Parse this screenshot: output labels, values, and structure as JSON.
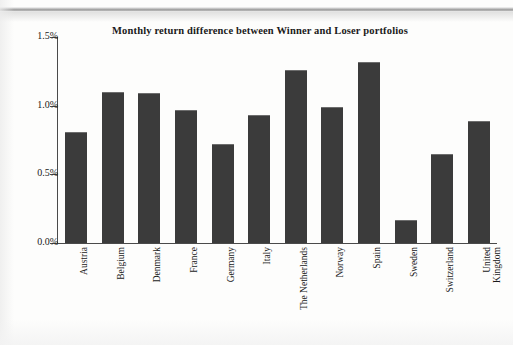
{
  "chart_data": {
    "type": "bar",
    "title": "Monthly return difference between Winner and Loser portfolios",
    "xlabel": "",
    "ylabel": "",
    "ylim": [
      0,
      1.5
    ],
    "ytick_labels": [
      "0.0%",
      "0.5%",
      "1.0%",
      "1.5%"
    ],
    "ytick_values": [
      0,
      0.5,
      1.0,
      1.5
    ],
    "grid": false,
    "legend": null,
    "unit": "%",
    "bar_color": "#3b3b3b",
    "axis_color": "#4a4a4a",
    "categories": [
      "Austria",
      "Belgium",
      "Denmark",
      "France",
      "Germany",
      "Italy",
      "The Netherlands",
      "Norway",
      "Spain",
      "Sweden",
      "Switzerland",
      "United\nKingdom"
    ],
    "values": [
      0.81,
      1.1,
      1.09,
      0.97,
      0.72,
      0.93,
      1.26,
      0.99,
      1.32,
      0.17,
      0.65,
      0.89
    ]
  }
}
